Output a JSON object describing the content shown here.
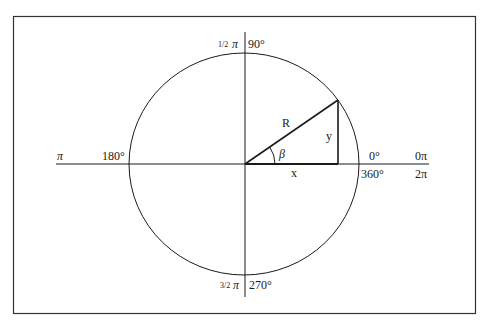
{
  "diagram": {
    "colors": {
      "stroke": "#1a1a1a",
      "frame": "#333333",
      "background": "#ffffff"
    },
    "labels": {
      "top_fraction": "1/2",
      "top_pi": "π",
      "top_deg": "90°",
      "bottom_fraction": "3/2",
      "bottom_pi": "π",
      "bottom_deg": "270°",
      "left_pi": "π",
      "left_deg": "180°",
      "right_deg_top": "0°",
      "right_rad_top": "0π",
      "right_deg_bottom": "360°",
      "right_rad_bottom": "2π",
      "radius": "R",
      "opposite": "y",
      "adjacent": "x",
      "angle": "β"
    }
  }
}
